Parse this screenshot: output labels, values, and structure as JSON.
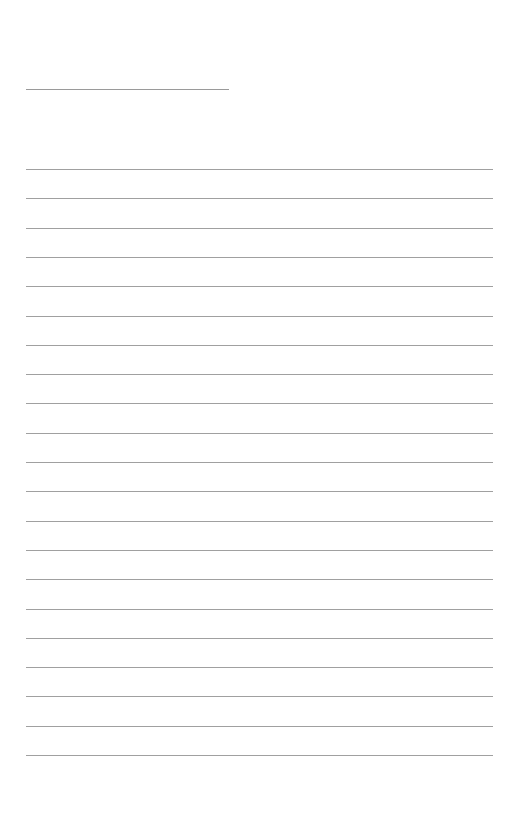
{
  "document": {
    "type": "lined-paper",
    "title_line": {
      "x": 26,
      "y": 89,
      "width": 203
    },
    "rules": {
      "count": 21,
      "x": 26,
      "width": 467,
      "first_y": 169,
      "spacing": 29.3
    },
    "colors": {
      "background": "#ffffff",
      "line": "#a0a0a0"
    }
  }
}
